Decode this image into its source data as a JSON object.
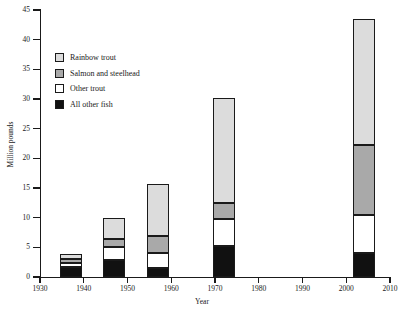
{
  "chart_data": {
    "type": "bar",
    "subtype": "stacked-bar",
    "title": "",
    "xlabel": "Year",
    "ylabel": "Million pounds",
    "xlim": [
      1930,
      2010
    ],
    "ylim": [
      0,
      45
    ],
    "xticks": [
      1930,
      1940,
      1950,
      1960,
      1970,
      1980,
      1990,
      2000,
      2010
    ],
    "yticks": [
      0,
      5,
      10,
      15,
      20,
      25,
      30,
      35,
      40,
      45
    ],
    "grid": false,
    "legend_position": "upper left",
    "categories": [
      1937,
      1947,
      1957,
      1972,
      2004
    ],
    "bar_width_years": 5,
    "stack_order_bottom_to_top": [
      "All other fish",
      "Other trout",
      "Salmon and steelhead",
      "Rainbow trout"
    ],
    "series": [
      {
        "name": "All other fish",
        "color": "#111111",
        "values": [
          1.7,
          2.8,
          1.5,
          5.2,
          4.1
        ]
      },
      {
        "name": "Other trout",
        "color": "#ffffff",
        "values": [
          0.6,
          2.2,
          2.5,
          4.6,
          6.4
        ]
      },
      {
        "name": "Salmon and steelhead",
        "color": "#a9a9a9",
        "values": [
          0.8,
          1.4,
          2.9,
          2.7,
          11.8
        ]
      },
      {
        "name": "Rainbow trout",
        "color": "#dcdcdc",
        "values": [
          0.7,
          3.5,
          8.7,
          17.6,
          21.2
        ]
      }
    ],
    "totals": [
      3.8,
      9.9,
      15.6,
      30.1,
      43.5
    ]
  },
  "legend": {
    "items": [
      {
        "label": "Rainbow trout",
        "color": "#dcdcdc"
      },
      {
        "label": "Salmon and steelhead",
        "color": "#a9a9a9"
      },
      {
        "label": "Other trout",
        "color": "#ffffff"
      },
      {
        "label": "All other fish",
        "color": "#111111"
      }
    ]
  },
  "axes": {
    "x_title": "Year",
    "y_title": "Million pounds",
    "x_tick_labels": [
      "1930",
      "1940",
      "1950",
      "1960",
      "1970",
      "1980",
      "1990",
      "2000",
      "2010"
    ],
    "y_tick_labels": [
      "0",
      "5",
      "10",
      "15",
      "20",
      "25",
      "30",
      "35",
      "40",
      "45"
    ]
  }
}
